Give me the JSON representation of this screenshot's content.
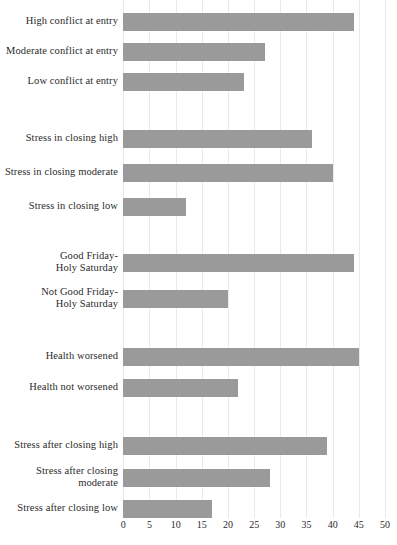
{
  "chart_data": {
    "type": "bar",
    "orientation": "horizontal",
    "title": "",
    "subtitle": "",
    "xlabel": "",
    "ylabel": "",
    "xlim": [
      0,
      50
    ],
    "xticks": [
      0,
      5,
      10,
      15,
      20,
      25,
      30,
      35,
      40,
      45,
      50
    ],
    "xtick_labels": [
      "0",
      "5",
      "10",
      "15",
      "20",
      "25",
      "30",
      "35",
      "40",
      "45",
      "50"
    ],
    "grid": true,
    "grid_axis": "x",
    "legend": false,
    "bar_color": "#9a9a9a",
    "grid_color": "#e9e9e9",
    "text_color": "#2b2b2b",
    "background": "#ffffff",
    "groups": [
      {
        "name": "conflict-at-entry",
        "categories": [
          "High conflict at entry",
          "Moderate conflict at entry",
          "Low conflict at entry"
        ],
        "values": [
          44,
          27,
          23
        ]
      },
      {
        "name": "stress-in-closing",
        "categories": [
          "Stress in closing high",
          "Stress in closing moderate",
          "Stress in closing low"
        ],
        "values": [
          36,
          40,
          12
        ]
      },
      {
        "name": "good-friday-holy-saturday",
        "categories": [
          "Good Friday-\nHoly Saturday",
          "Not Good Friday-\nHoly Saturday"
        ],
        "values": [
          44,
          20
        ]
      },
      {
        "name": "health",
        "categories": [
          "Health worsened",
          "Health not worsened"
        ],
        "values": [
          45,
          22
        ]
      },
      {
        "name": "stress-after-closing",
        "categories": [
          "Stress after closing high",
          "Stress after closing\nmoderate",
          "Stress after closing low"
        ],
        "values": [
          39,
          28,
          17
        ]
      }
    ],
    "categories": [
      "High conflict at entry",
      "Moderate conflict at entry",
      "Low conflict at entry",
      "Stress in closing high",
      "Stress in closing moderate",
      "Stress in closing low",
      "Good Friday-\nHoly Saturday",
      "Not Good Friday-\nHoly Saturday",
      "Health worsened",
      "Health not worsened",
      "Stress after closing high",
      "Stress after closing\nmoderate",
      "Stress after closing low"
    ],
    "values": [
      44,
      27,
      23,
      36,
      40,
      12,
      44,
      20,
      45,
      22,
      39,
      28,
      17
    ]
  },
  "layout": {
    "rows": [
      {
        "label_index": 0,
        "top": 13,
        "label_top": 15,
        "lines": 1
      },
      {
        "label_index": 1,
        "top": 43,
        "label_top": 45,
        "lines": 1
      },
      {
        "label_index": 2,
        "top": 73,
        "label_top": 75,
        "lines": 1
      },
      {
        "label_index": 3,
        "top": 130,
        "label_top": 132,
        "lines": 1
      },
      {
        "label_index": 4,
        "top": 164,
        "label_top": 166,
        "lines": 1
      },
      {
        "label_index": 5,
        "top": 198,
        "label_top": 200,
        "lines": 1
      },
      {
        "label_index": 6,
        "top": 254,
        "label_top": 250,
        "lines": 2
      },
      {
        "label_index": 7,
        "top": 290,
        "label_top": 286,
        "lines": 2
      },
      {
        "label_index": 8,
        "top": 348,
        "label_top": 350,
        "lines": 1
      },
      {
        "label_index": 9,
        "top": 379,
        "label_top": 381,
        "lines": 1
      },
      {
        "label_index": 10,
        "top": 437,
        "label_top": 439,
        "lines": 1
      },
      {
        "label_index": 11,
        "top": 469,
        "label_top": 465,
        "lines": 2
      },
      {
        "label_index": 12,
        "top": 500,
        "label_top": 502,
        "lines": 1
      }
    ]
  }
}
